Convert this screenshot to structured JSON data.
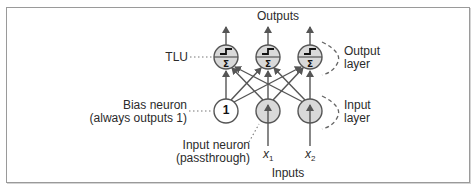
{
  "diagram": {
    "title_top": "Outputs",
    "title_bottom": "Inputs",
    "labels": {
      "tlu": "TLU",
      "bias_neuron_line1": "Bias neuron",
      "bias_neuron_line2": "(always outputs 1)",
      "input_neuron_line1": "Input neuron",
      "input_neuron_line2": "(passthrough)",
      "output_layer_line1": "Output",
      "output_layer_line2": "layer",
      "input_layer_line1": "Input",
      "input_layer_line2": "layer"
    },
    "bias_value": "1",
    "inputs": [
      {
        "symbol": "x",
        "subscript": "1"
      },
      {
        "symbol": "x",
        "subscript": "2"
      }
    ],
    "output_neurons": [
      {
        "type": "TLU",
        "top_glyph": "step",
        "bottom_glyph": "Σ"
      },
      {
        "type": "TLU",
        "top_glyph": "step",
        "bottom_glyph": "Σ"
      },
      {
        "type": "TLU",
        "top_glyph": "step",
        "bottom_glyph": "Σ"
      }
    ],
    "colors": {
      "line": "#555555",
      "neuron_fill": "#d9d9d9",
      "bias_fill": "#ffffff",
      "border": "#9a9a9a",
      "text": "#2b2b2b"
    }
  }
}
